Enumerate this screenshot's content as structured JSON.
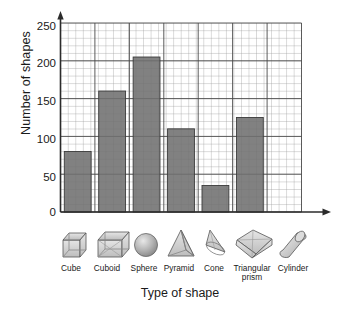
{
  "chart_data": {
    "type": "bar",
    "title": "",
    "xlabel": "Type of shape",
    "ylabel": "Number of shapes",
    "categories": [
      "Cube",
      "Cuboid",
      "Sphere",
      "Pyramid",
      "Cone",
      "Triangular prism",
      "Cylinder"
    ],
    "values": [
      80,
      160,
      205,
      110,
      35,
      125,
      0
    ],
    "ylim": [
      0,
      250
    ],
    "yticks": [
      0,
      50,
      100,
      150,
      200,
      250
    ],
    "ytick_labels": [
      "0",
      "50",
      "100",
      "150",
      "200",
      "250"
    ],
    "grid": true,
    "minor_grid_step": 10,
    "major_grid_step": 50,
    "legend": "none",
    "bar_color": "#6f6f6f",
    "grid_color": "#8c8c8c",
    "axis_color": "#2b2b2b",
    "icons": [
      "cube-icon",
      "cuboid-icon",
      "sphere-icon",
      "pyramid-icon",
      "cone-icon",
      "triangular-prism-icon",
      "cylinder-icon"
    ]
  },
  "axis": {
    "y_title": "Number of shapes",
    "x_title": "Type of shape",
    "t0": "0",
    "t1": "50",
    "t2": "100",
    "t3": "150",
    "t4": "200",
    "t5": "250"
  },
  "categories": {
    "c0": "Cube",
    "c1": "Cuboid",
    "c2": "Sphere",
    "c3": "Pyramid",
    "c4": "Cone",
    "c5a": "Triangular",
    "c5b": "prism",
    "c6": "Cylinder"
  }
}
